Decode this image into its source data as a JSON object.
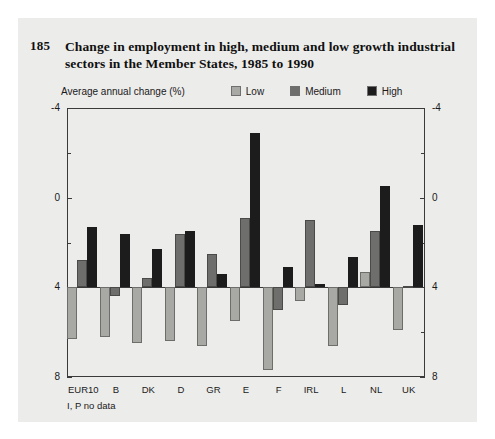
{
  "figure": {
    "number": "185",
    "title": "Change in employment in high, medium and low growth industrial sectors in the Member States, 1985 to 1990",
    "footnote": "I, P no data"
  },
  "legend": {
    "caption": "Average annual change (%)",
    "items": [
      {
        "label": "Low",
        "color": "#a8a8a4"
      },
      {
        "label": "Medium",
        "color": "#6e6e6c"
      },
      {
        "label": "High",
        "color": "#1c1c1c"
      }
    ]
  },
  "axis": {
    "y_ticks": [
      "8",
      "4",
      "0",
      "-4"
    ],
    "y_minor": [
      6,
      2,
      -2
    ],
    "left_labels": [
      "8",
      "4",
      "0",
      "-4"
    ],
    "right_labels": [
      "8",
      "4",
      "0",
      "-4"
    ]
  },
  "chart_data": {
    "type": "bar",
    "title": "Change in employment in high, medium and low growth industrial sectors in the Member States, 1985 to 1990",
    "xlabel": "",
    "ylabel": "Average annual change (%)",
    "ylim": [
      -4,
      8
    ],
    "yticks": [
      -4,
      0,
      4,
      8
    ],
    "grid": false,
    "legend_position": "top",
    "categories": [
      "EUR10",
      "B",
      "DK",
      "D",
      "GR",
      "E",
      "F",
      "IRL",
      "L",
      "NL",
      "UK"
    ],
    "series": [
      {
        "name": "Low",
        "color": "#a8a8a4",
        "values": [
          -2.3,
          -2.2,
          -2.5,
          -2.4,
          -2.6,
          -1.5,
          -3.7,
          -0.6,
          -2.6,
          0.7,
          -1.9
        ]
      },
      {
        "name": "Medium",
        "color": "#6e6e6c",
        "values": [
          1.2,
          -0.4,
          0.4,
          2.4,
          1.5,
          3.1,
          -1.0,
          3.0,
          -0.8,
          2.5,
          0.05
        ]
      },
      {
        "name": "High",
        "color": "#1c1c1c",
        "values": [
          2.7,
          2.4,
          1.7,
          2.5,
          0.6,
          6.9,
          0.9,
          0.15,
          1.35,
          4.5,
          2.8
        ]
      }
    ]
  }
}
